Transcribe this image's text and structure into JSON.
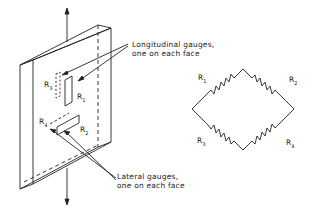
{
  "diagram": {
    "specimen": {
      "description": "bar under axial load with strain gauges"
    },
    "labels": {
      "longitudinal_line1": "Longitudinal gauges,",
      "longitudinal_line2": "one on each face",
      "lateral_line1": "Lateral gauges,",
      "lateral_line2": "one on each face"
    },
    "gauges": {
      "r1": {
        "main": "R",
        "sub": "1"
      },
      "r2": {
        "main": "R",
        "sub": "2"
      },
      "r3": {
        "main": "R",
        "sub": "3"
      },
      "r4": {
        "main": "R",
        "sub": "4"
      }
    },
    "bridge": {
      "r1": {
        "main": "R",
        "sub": "1"
      },
      "r2": {
        "main": "R",
        "sub": "2"
      },
      "r3": {
        "main": "R",
        "sub": "3"
      },
      "r4": {
        "main": "R",
        "sub": "4"
      }
    },
    "line_color": "#222222"
  }
}
